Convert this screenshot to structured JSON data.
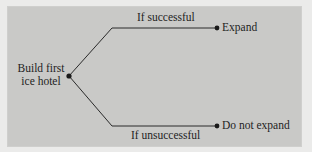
{
  "diagram": {
    "type": "decision-tree",
    "root": {
      "label_line1": "Build first",
      "label_line2": "ice hotel"
    },
    "branches": [
      {
        "condition": "If successful",
        "outcome": "Expand"
      },
      {
        "condition": "If unsuccessful",
        "outcome": "Do not expand"
      }
    ],
    "colors": {
      "panel_background": "#c9c9c7",
      "page_background": "#ebebea",
      "line": "#2a2a2a",
      "text": "#1e1e1e"
    }
  }
}
